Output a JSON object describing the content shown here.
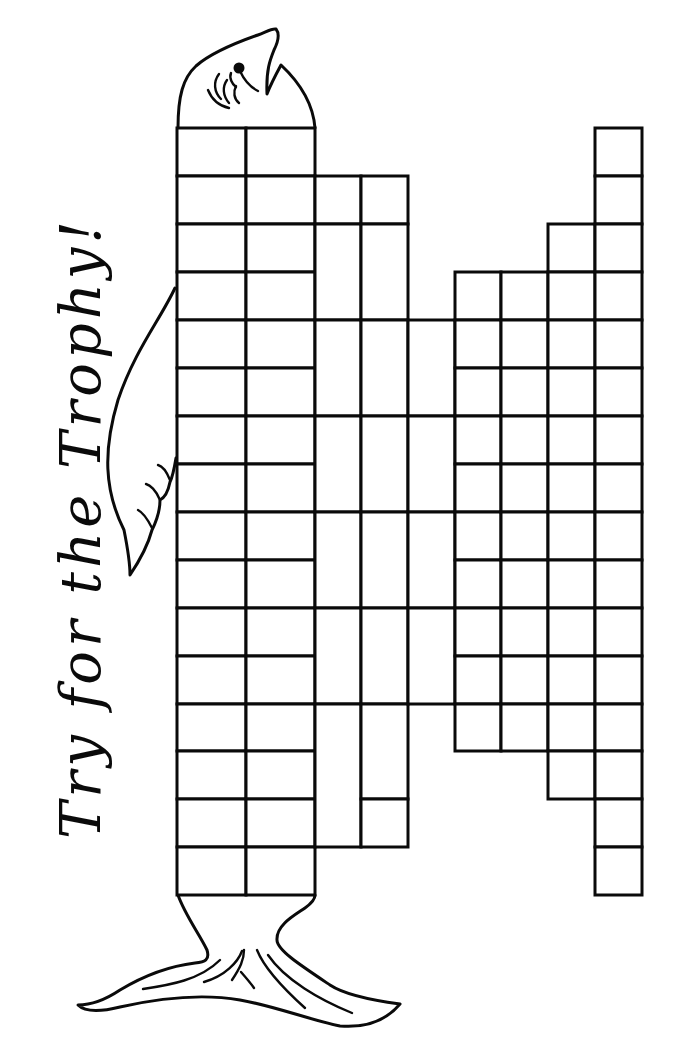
{
  "title": "Try for the Trophy!",
  "colors": {
    "ink": "#0a0a0a",
    "paper": "#ffffff"
  },
  "figure": {
    "parts": [
      "fish-head-icon",
      "fish-eye-icon",
      "fish-fin-icon",
      "fish-tail-icon"
    ]
  },
  "grid": {
    "row_height": 48,
    "columns": [
      {
        "id": "A",
        "x": 177,
        "w": 69,
        "cells": [
          [
            128,
            48
          ],
          [
            176,
            48
          ],
          [
            224,
            48
          ],
          [
            272,
            48
          ],
          [
            320,
            48
          ],
          [
            368,
            48
          ],
          [
            416,
            48
          ],
          [
            464,
            48
          ],
          [
            512,
            48
          ],
          [
            560,
            48
          ],
          [
            608,
            48
          ],
          [
            656,
            48
          ],
          [
            704,
            47
          ],
          [
            751,
            48
          ],
          [
            799,
            48
          ],
          [
            847,
            48
          ]
        ]
      },
      {
        "id": "B",
        "x": 246,
        "w": 69,
        "cells": [
          [
            128,
            48
          ],
          [
            176,
            48
          ],
          [
            224,
            48
          ],
          [
            272,
            48
          ],
          [
            320,
            48
          ],
          [
            368,
            48
          ],
          [
            416,
            48
          ],
          [
            464,
            48
          ],
          [
            512,
            48
          ],
          [
            560,
            48
          ],
          [
            608,
            48
          ],
          [
            656,
            48
          ],
          [
            704,
            47
          ],
          [
            751,
            48
          ],
          [
            799,
            48
          ],
          [
            847,
            48
          ]
        ]
      },
      {
        "id": "C",
        "x": 315,
        "w": 46,
        "cells": [
          [
            176,
            48
          ],
          [
            224,
            96
          ],
          [
            320,
            96
          ],
          [
            416,
            96
          ],
          [
            512,
            96
          ],
          [
            608,
            96
          ],
          [
            704,
            143
          ]
        ]
      },
      {
        "id": "D",
        "x": 361,
        "w": 47,
        "cells": [
          [
            176,
            48
          ],
          [
            224,
            96
          ],
          [
            320,
            96
          ],
          [
            416,
            96
          ],
          [
            512,
            96
          ],
          [
            608,
            96
          ],
          [
            704,
            95
          ],
          [
            799,
            48
          ]
        ]
      },
      {
        "id": "E",
        "x": 408,
        "w": 47,
        "cells": [
          [
            320,
            96
          ],
          [
            416,
            96
          ],
          [
            512,
            96
          ],
          [
            608,
            96
          ]
        ]
      },
      {
        "id": "F",
        "x": 455,
        "w": 46,
        "cells": [
          [
            272,
            48
          ],
          [
            320,
            48
          ],
          [
            368,
            48
          ],
          [
            416,
            48
          ],
          [
            464,
            48
          ],
          [
            512,
            48
          ],
          [
            560,
            48
          ],
          [
            608,
            48
          ],
          [
            656,
            48
          ],
          [
            704,
            47
          ]
        ]
      },
      {
        "id": "G",
        "x": 501,
        "w": 47,
        "cells": [
          [
            272,
            48
          ],
          [
            320,
            48
          ],
          [
            368,
            48
          ],
          [
            416,
            48
          ],
          [
            464,
            48
          ],
          [
            512,
            48
          ],
          [
            560,
            48
          ],
          [
            608,
            48
          ],
          [
            656,
            48
          ],
          [
            704,
            47
          ]
        ]
      },
      {
        "id": "H",
        "x": 548,
        "w": 47,
        "cells": [
          [
            224,
            48
          ],
          [
            272,
            48
          ],
          [
            320,
            48
          ],
          [
            368,
            48
          ],
          [
            416,
            48
          ],
          [
            464,
            48
          ],
          [
            512,
            48
          ],
          [
            560,
            48
          ],
          [
            608,
            48
          ],
          [
            656,
            48
          ],
          [
            704,
            47
          ],
          [
            751,
            48
          ]
        ]
      },
      {
        "id": "I",
        "x": 595,
        "w": 47,
        "cells": [
          [
            128,
            48
          ],
          [
            176,
            48
          ],
          [
            224,
            48
          ],
          [
            272,
            48
          ],
          [
            320,
            48
          ],
          [
            368,
            48
          ],
          [
            416,
            48
          ],
          [
            464,
            48
          ],
          [
            512,
            48
          ],
          [
            560,
            48
          ],
          [
            608,
            48
          ],
          [
            656,
            48
          ],
          [
            704,
            47
          ],
          [
            751,
            48
          ],
          [
            799,
            48
          ],
          [
            847,
            48
          ]
        ]
      }
    ],
    "total_cells": 99
  }
}
